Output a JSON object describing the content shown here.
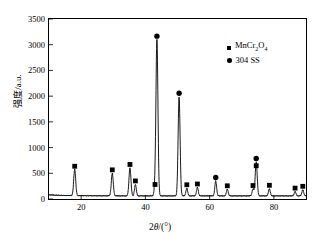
{
  "chart_data": {
    "type": "line",
    "title": "",
    "xlabel": "2θ/(°)",
    "ylabel": "强度/a.u.",
    "xlim": [
      10,
      90
    ],
    "ylim": [
      0,
      3500
    ],
    "xticks": [
      20,
      40,
      60,
      80
    ],
    "yticks": [
      0,
      500,
      1000,
      1500,
      2000,
      2500,
      3000,
      3500
    ],
    "grid": false,
    "legend_position": "top-right",
    "legend": [
      {
        "marker": "square",
        "label": "MnCr2O4"
      },
      {
        "marker": "circle",
        "label": "304 SS"
      }
    ],
    "baseline": 60,
    "series": [
      {
        "name": "XRD pattern",
        "peaks": [
          {
            "x": 18.0,
            "y": 520,
            "marker": "square",
            "width": 0.55
          },
          {
            "x": 29.7,
            "y": 450,
            "marker": "square",
            "width": 0.55
          },
          {
            "x": 35.2,
            "y": 555,
            "marker": "square",
            "width": 0.55
          },
          {
            "x": 36.9,
            "y": 235,
            "marker": "square",
            "width": 0.5
          },
          {
            "x": 43.0,
            "y": 165,
            "marker": "square",
            "width": 0.5
          },
          {
            "x": 43.6,
            "y": 3050,
            "marker": "circle",
            "width": 0.55
          },
          {
            "x": 50.5,
            "y": 1940,
            "marker": "circle",
            "width": 0.55
          },
          {
            "x": 52.9,
            "y": 160,
            "marker": "square",
            "width": 0.5
          },
          {
            "x": 56.2,
            "y": 175,
            "marker": "square",
            "width": 0.5
          },
          {
            "x": 61.9,
            "y": 300,
            "marker": "circle",
            "width": 0.5
          },
          {
            "x": 65.5,
            "y": 140,
            "marker": "square",
            "width": 0.5
          },
          {
            "x": 73.5,
            "y": 145,
            "marker": "square",
            "width": 0.5
          },
          {
            "x": 74.5,
            "y": 670,
            "marker": "circle",
            "width": 0.55
          },
          {
            "x": 74.5,
            "y": 530,
            "marker": "square",
            "width": 0.0
          },
          {
            "x": 78.6,
            "y": 150,
            "marker": "square",
            "width": 0.5
          },
          {
            "x": 86.6,
            "y": 95,
            "marker": "square",
            "width": 0.5
          },
          {
            "x": 89.0,
            "y": 130,
            "marker": "square",
            "width": 0.5
          }
        ]
      }
    ]
  },
  "axes": {
    "y_label_text": "强度/a.u.",
    "x_label_prefix": "2",
    "x_label_theta": "θ",
    "x_label_suffix": "/(°)"
  },
  "legend": {
    "item1": "MnCr",
    "item1_sub1": "2",
    "item1_mid": "O",
    "item1_sub2": "4",
    "item2": "304 SS"
  }
}
